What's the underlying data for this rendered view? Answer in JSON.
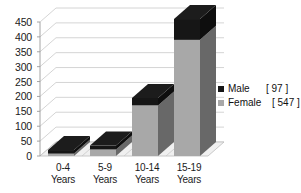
{
  "chart_data": {
    "type": "bar",
    "subtype": "stacked-column-3d",
    "title": "",
    "xlabel": "",
    "ylabel": "",
    "categories": [
      "0-4 Years",
      "5-9 Years",
      "10-14 Years",
      "15-19 Years"
    ],
    "category_lines": [
      [
        "0-4",
        "Years"
      ],
      [
        "5-9",
        "Years"
      ],
      [
        "10-14",
        "Years"
      ],
      [
        "15-19",
        "Years"
      ]
    ],
    "series": [
      {
        "name": "Female",
        "total_label": "[ 547 ]",
        "color": "#a8a8a8",
        "values": [
          8,
          22,
          170,
          390
        ]
      },
      {
        "name": "Male",
        "total_label": "[ 97 ]",
        "color": "#161616",
        "values": [
          12,
          13,
          25,
          70
        ]
      }
    ],
    "stack_totals": [
      20,
      35,
      195,
      460
    ],
    "ylim": [
      0,
      450
    ],
    "yticks": [
      0,
      50,
      100,
      150,
      200,
      250,
      300,
      350,
      400,
      450
    ],
    "ytick_labels": [
      "0",
      "50",
      "100",
      "150",
      "200",
      "250",
      "300",
      "350",
      "400",
      "450"
    ],
    "grid": true,
    "legend_position": "right"
  },
  "legend": {
    "entries": [
      {
        "name": "Male",
        "value": "[ 97 ]",
        "swatch": "#161616"
      },
      {
        "name": "Female",
        "value": "[ 547 ]",
        "swatch": "#a8a8a8"
      }
    ]
  },
  "colors": {
    "male": "#161616",
    "female": "#a8a8a8",
    "male_top": "#2e2e2e",
    "male_side": "#000000",
    "female_side": "#8f8f8f",
    "gridline": "#c9c9c9",
    "axis": "#9a9a9a",
    "floor": "#e8e8e8",
    "text": "#1b1b1b",
    "background": "#ffffff"
  }
}
